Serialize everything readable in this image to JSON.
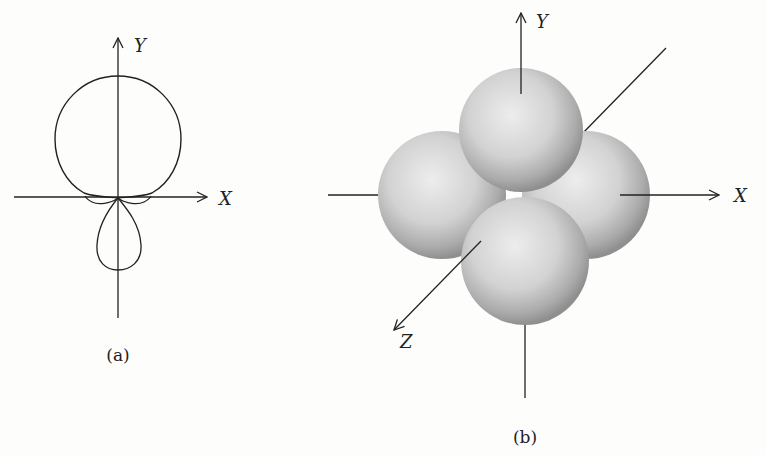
{
  "figure": {
    "panel_a": {
      "caption": "(a)",
      "axis_labels": {
        "x": "X",
        "y": "Y"
      },
      "description": "Polar plot of orbital angular distribution: large upper lobe, small lower lobe, small side lobes at node"
    },
    "panel_b": {
      "caption": "(b)",
      "axis_labels": {
        "x": "X",
        "y": "Y",
        "z": "Z"
      },
      "description": "Four shaded spherical lobes arranged along X and Y axes"
    },
    "colors": {
      "background": "#fdfdfc",
      "line": "#222222",
      "sphere_light": "#ececec",
      "sphere_mid": "#c9c9c9",
      "sphere_dark": "#8e8e8e"
    }
  }
}
